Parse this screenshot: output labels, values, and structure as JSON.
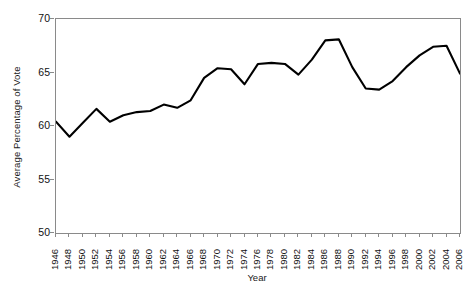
{
  "chart_data": {
    "type": "line",
    "title": "",
    "xlabel": "Year",
    "ylabel": "Average Percentage of Vote",
    "xlim": [
      1946,
      2006
    ],
    "ylim": [
      50,
      70
    ],
    "yticks": [
      50,
      55,
      60,
      65,
      70
    ],
    "grid": false,
    "legend": "none",
    "line_color": "#000000",
    "axis_color": "#8a8a8a",
    "x": [
      1946,
      1948,
      1950,
      1952,
      1954,
      1956,
      1958,
      1960,
      1962,
      1964,
      1966,
      1968,
      1970,
      1972,
      1974,
      1976,
      1978,
      1980,
      1982,
      1984,
      1986,
      1988,
      1990,
      1992,
      1994,
      1996,
      1998,
      2000,
      2002,
      2004,
      2006
    ],
    "categories": [
      "1946",
      "1948",
      "1950",
      "1952",
      "1954",
      "1956",
      "1958",
      "1960",
      "1962",
      "1964",
      "1966",
      "1968",
      "1970",
      "1972",
      "1974",
      "1976",
      "1978",
      "1980",
      "1982",
      "1984",
      "1986",
      "1988",
      "1990",
      "1992",
      "1994",
      "1996",
      "1998",
      "2000",
      "2002",
      "2004",
      "2006"
    ],
    "values": [
      60.4,
      59.0,
      60.3,
      61.6,
      60.4,
      61.0,
      61.3,
      61.4,
      62.0,
      61.7,
      62.4,
      64.5,
      65.4,
      65.3,
      63.9,
      65.8,
      65.9,
      65.8,
      64.8,
      66.2,
      68.0,
      68.1,
      65.5,
      63.5,
      63.4,
      64.2,
      65.5,
      66.6,
      67.4,
      67.5,
      64.9
    ],
    "series": [
      {
        "name": "Average Percentage of Vote",
        "values": [
          60.4,
          59.0,
          60.3,
          61.6,
          60.4,
          61.0,
          61.3,
          61.4,
          62.0,
          61.7,
          62.4,
          64.5,
          65.4,
          65.3,
          63.9,
          65.8,
          65.9,
          65.8,
          64.8,
          66.2,
          68.0,
          68.1,
          65.5,
          63.5,
          63.4,
          64.2,
          65.5,
          66.6,
          67.4,
          67.5,
          64.9
        ]
      }
    ]
  }
}
